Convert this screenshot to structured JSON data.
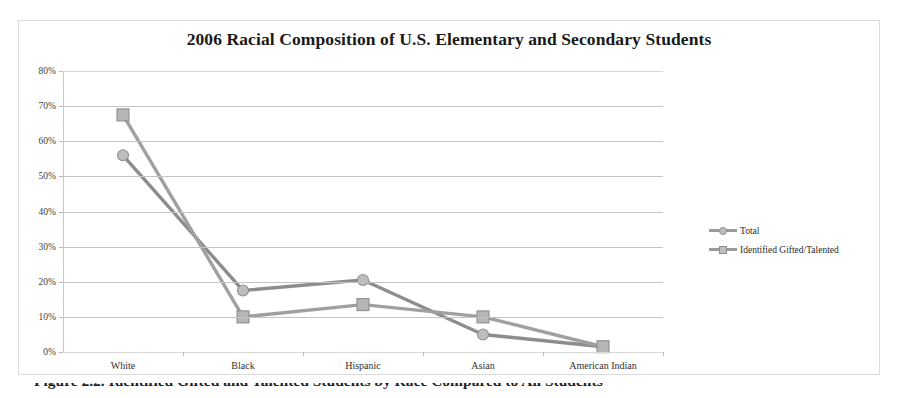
{
  "figure": {
    "title": "2006 Racial Composition of U.S. Elementary and Secondary Students",
    "caption_partial": "Figure 2.2. Identified Gifted and Talented Students by Race Compared to All Students"
  },
  "legend": {
    "position": "right",
    "entries": [
      {
        "label": "Total",
        "marker": "circle",
        "color": "#9a9a9a"
      },
      {
        "label": "Identified Gifted/Talented",
        "marker": "square",
        "color": "#a0a0a0"
      }
    ]
  },
  "axes": {
    "y_ticks": [
      "0%",
      "10%",
      "20%",
      "30%",
      "40%",
      "50%",
      "60%",
      "70%",
      "80%"
    ],
    "x_ticks": [
      "White",
      "Black",
      "Hispanic",
      "Asian",
      "American Indian"
    ]
  },
  "chart_data": {
    "type": "line",
    "title": "2006 Racial Composition of U.S. Elementary and Secondary Students",
    "xlabel": "",
    "ylabel": "",
    "categories": [
      "White",
      "Black",
      "Hispanic",
      "Asian",
      "American Indian"
    ],
    "series": [
      {
        "name": "Total",
        "marker": "circle",
        "color": "#9a9a9a",
        "values": [
          56,
          17.5,
          20.5,
          5,
          1.5
        ]
      },
      {
        "name": "Identified Gifted/Talented",
        "marker": "square",
        "color": "#a0a0a0",
        "values": [
          67.5,
          10,
          13.5,
          10,
          1.5
        ]
      }
    ],
    "ylim": [
      0,
      80
    ],
    "ytick_step": 10,
    "ytick_format": "percent",
    "grid": true,
    "grid_axis": "y",
    "legend": true,
    "legend_position": "right"
  }
}
